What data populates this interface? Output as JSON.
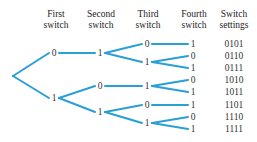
{
  "headers": [
    {
      "line1": "First",
      "line2": "switch",
      "x": 56
    },
    {
      "line1": "Second",
      "line2": "switch",
      "x": 101
    },
    {
      "line1": "Third",
      "line2": "switch",
      "x": 148
    },
    {
      "line1": "Fourth",
      "line2": "switch",
      "x": 194
    },
    {
      "line1": "Switch",
      "line2": "settings",
      "x": 234
    }
  ],
  "colors": {
    "edge": "#2a9fd6",
    "text": "#333333"
  },
  "root": {
    "x": 13,
    "y": 76
  },
  "nodes": [
    {
      "id": "s1_0",
      "label": "0",
      "x": 54,
      "y": 53,
      "parent": "root"
    },
    {
      "id": "s1_1",
      "label": "1",
      "x": 54,
      "y": 98,
      "parent": "root"
    },
    {
      "id": "s2_01",
      "label": "1",
      "x": 100,
      "y": 53,
      "parent": "s1_0"
    },
    {
      "id": "s2_10",
      "label": "0",
      "x": 100,
      "y": 86,
      "parent": "s1_1"
    },
    {
      "id": "s2_11",
      "label": "1",
      "x": 100,
      "y": 112,
      "parent": "s1_1"
    },
    {
      "id": "s3_010",
      "label": "0",
      "x": 147,
      "y": 44,
      "parent": "s2_01"
    },
    {
      "id": "s3_011",
      "label": "1",
      "x": 147,
      "y": 62,
      "parent": "s2_01"
    },
    {
      "id": "s3_101",
      "label": "1",
      "x": 147,
      "y": 86,
      "parent": "s2_10"
    },
    {
      "id": "s3_110",
      "label": "0",
      "x": 147,
      "y": 105,
      "parent": "s2_11"
    },
    {
      "id": "s3_111",
      "label": "1",
      "x": 147,
      "y": 123,
      "parent": "s2_11"
    },
    {
      "id": "s4_0101",
      "label": "1",
      "x": 193,
      "y": 44,
      "parent": "s3_010"
    },
    {
      "id": "s4_0110",
      "label": "0",
      "x": 193,
      "y": 56,
      "parent": "s3_011"
    },
    {
      "id": "s4_0111",
      "label": "1",
      "x": 193,
      "y": 68,
      "parent": "s3_011"
    },
    {
      "id": "s4_1010",
      "label": "0",
      "x": 193,
      "y": 80,
      "parent": "s3_101"
    },
    {
      "id": "s4_1011",
      "label": "1",
      "x": 193,
      "y": 92,
      "parent": "s3_101"
    },
    {
      "id": "s4_1101",
      "label": "1",
      "x": 193,
      "y": 105,
      "parent": "s3_110"
    },
    {
      "id": "s4_1110",
      "label": "0",
      "x": 193,
      "y": 117,
      "parent": "s3_111"
    },
    {
      "id": "s4_1111",
      "label": "1",
      "x": 193,
      "y": 129,
      "parent": "s3_111"
    }
  ],
  "settings": [
    {
      "value": "0101",
      "y": 44
    },
    {
      "value": "0110",
      "y": 56
    },
    {
      "value": "0111",
      "y": 68
    },
    {
      "value": "1010",
      "y": 80
    },
    {
      "value": "1011",
      "y": 92
    },
    {
      "value": "1101",
      "y": 105
    },
    {
      "value": "1110",
      "y": 117
    },
    {
      "value": "1111",
      "y": 129
    }
  ],
  "settings_x": 234
}
